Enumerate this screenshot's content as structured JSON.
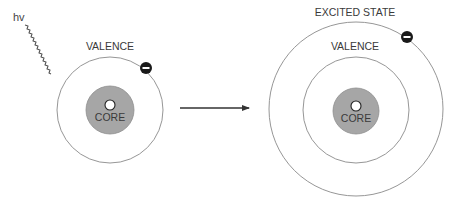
{
  "photon": {
    "label": "hv",
    "wave_start": [
      25,
      25
    ],
    "wave_end": [
      69,
      77
    ]
  },
  "ground_state_atom": {
    "center": [
      110,
      110
    ],
    "valence_label": "VALENCE",
    "valence_radius": 53,
    "core_label": "CORE",
    "core_radius": 24,
    "nucleus_radius": 5,
    "electron": {
      "position": [
        146,
        68
      ],
      "symbol": "minus"
    }
  },
  "transition_arrow": {
    "from": [
      180,
      108
    ],
    "to": [
      249,
      108
    ]
  },
  "excited_state_atom": {
    "center": [
      356,
      110
    ],
    "excited_label": "EXCITED STATE",
    "excited_radius": 87,
    "valence_label": "VALENCE",
    "valence_radius": 53,
    "core_label": "CORE",
    "core_radius": 23,
    "nucleus_radius": 5,
    "electron": {
      "position": [
        407,
        37
      ],
      "symbol": "minus"
    }
  },
  "colors": {
    "orbit_stroke": "#8a8a8a",
    "core_fill": "#a6a6a6",
    "core_stroke": "#8e8e8e",
    "electron_fill": "#1a1a1a",
    "arrow": "#333333",
    "text": "#3a3a3a"
  }
}
